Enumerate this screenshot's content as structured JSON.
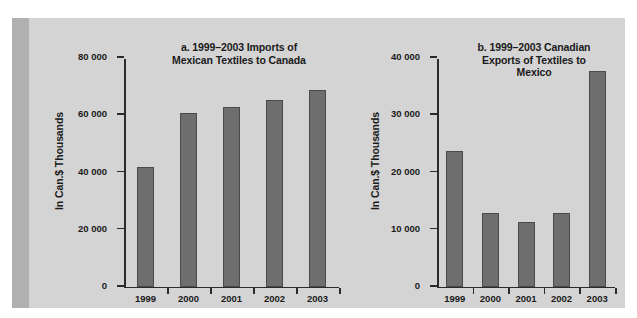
{
  "top_caption": "",
  "figure": {
    "background_color": "#d4d4d4",
    "accent_color": "#b0b0b0",
    "bar_color": "#6e6e6e",
    "axis_color": "#2b2b2b",
    "text_color": "#1a1a1a"
  },
  "chart_data": [
    {
      "id": "a",
      "type": "bar",
      "title": "a. 1999–2003 Imports of Mexican Textiles to Canada",
      "title_lines": [
        "a. 1999–2003 Imports of",
        "Mexican Textiles to Canada"
      ],
      "xlabel": "",
      "ylabel": "In Can.$ Thousands",
      "categories": [
        "1999",
        "2000",
        "2001",
        "2002",
        "2003"
      ],
      "values": [
        41900,
        60600,
        62700,
        65000,
        68500
      ],
      "ylim": [
        0,
        80000
      ],
      "ytick_values": [
        0,
        20000,
        40000,
        60000,
        80000
      ],
      "ytick_labels": [
        "0",
        "20 000",
        "40 000",
        "60 000",
        "80 000"
      ],
      "grid": false,
      "legend": "none"
    },
    {
      "id": "b",
      "type": "bar",
      "title": "b. 1999–2003 Canadian Exports of Textiles to Mexico",
      "title_lines": [
        "b. 1999–2003 Canadian",
        "Exports of Textiles to",
        "Mexico"
      ],
      "xlabel": "",
      "ylabel": "In Can.$ Thousands",
      "categories": [
        "1999",
        "2000",
        "2001",
        "2002",
        "2003"
      ],
      "values": [
        23700,
        12800,
        11300,
        12900,
        37700
      ],
      "ylim": [
        0,
        40000
      ],
      "ytick_values": [
        0,
        10000,
        20000,
        30000,
        40000
      ],
      "ytick_labels": [
        "0",
        "10 000",
        "20 000",
        "30 000",
        "40 000"
      ],
      "grid": false,
      "legend": "none"
    }
  ]
}
